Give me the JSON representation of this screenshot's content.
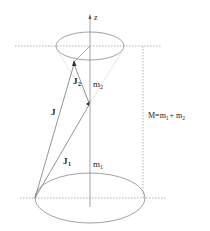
{
  "diagram": {
    "axis_label": "z",
    "vectors": {
      "J": "J",
      "J1": "J",
      "J1_sub": "1",
      "J2": "J",
      "J2_sub": "2"
    },
    "projections": {
      "m1": "m",
      "m1_sub": "1",
      "m2": "m",
      "m2_sub": "2"
    },
    "total": {
      "prefix": "M=m",
      "sub1": "1",
      "plus": "+ m",
      "sub2": "2"
    },
    "colors": {
      "line": "#9a9a9a",
      "dotted": "#a0a0a0",
      "text": "#222222"
    }
  }
}
